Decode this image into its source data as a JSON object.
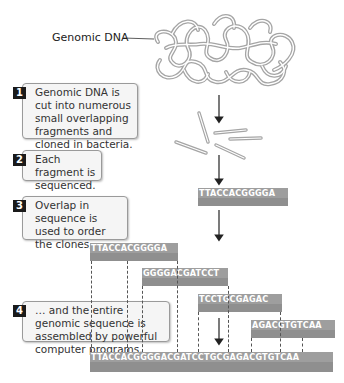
{
  "labels": {
    "genomic_dna": "Genomic DNA"
  },
  "steps": [
    {
      "number": "1",
      "text": "Genomic DNA is cut into numerous small overlapping fragments and cloned in bacteria."
    },
    {
      "number": "2",
      "text": "Each fragment is sequenced."
    },
    {
      "number": "3",
      "text": "Overlap in sequence is used to order the clones,…"
    },
    {
      "number": "4",
      "text": "… and the entire genomic sequence is assembled by powerful computer programs."
    }
  ],
  "sequences": {
    "sequenced_fragment": "TTACCACGGGGA",
    "fragments": [
      "TTACCACGGGGA",
      "GGGGACGATCCT",
      "TCCTGCGAGAC",
      "AGACGTGTCAA"
    ],
    "assembled": "TTACCACGGGGACGATCCTGCGAGACGTGTCAA"
  },
  "colors": {
    "sequence_bar": "#9e9e9e",
    "step_number_bg": "#1a1a1a",
    "dna_strand": "#a8a8a8"
  }
}
